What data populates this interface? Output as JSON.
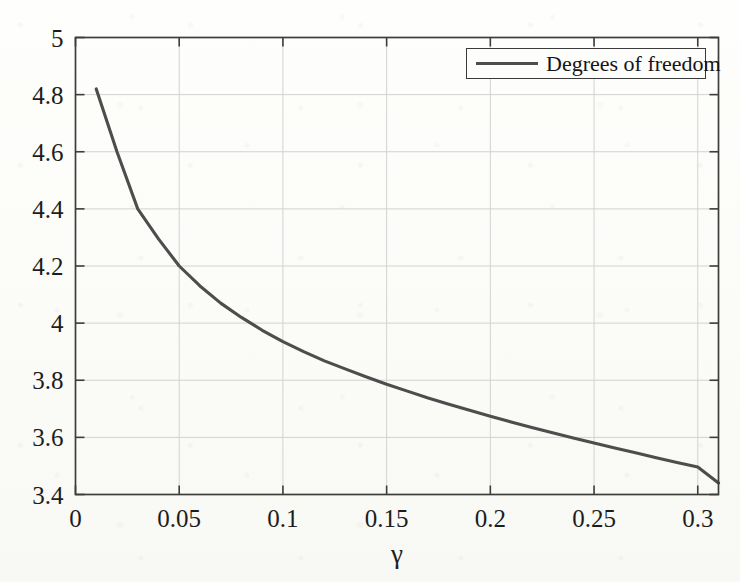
{
  "chart_data": {
    "type": "line",
    "title": "",
    "xlabel": "γ",
    "ylabel": "",
    "xlim": [
      0,
      0.31
    ],
    "ylim": [
      3.4,
      5.0
    ],
    "grid": true,
    "legend_position": "top-right",
    "x_ticks": [
      "0",
      "0.05",
      "0.1",
      "0.15",
      "0.2",
      "0.25",
      "0.3"
    ],
    "x_tick_values": [
      0,
      0.05,
      0.1,
      0.15,
      0.2,
      0.25,
      0.3
    ],
    "y_ticks": [
      "3.4",
      "3.6",
      "3.8",
      "4",
      "4.2",
      "4.4",
      "4.6",
      "4.8",
      "5"
    ],
    "y_tick_values": [
      3.4,
      3.6,
      3.8,
      4.0,
      4.2,
      4.4,
      4.6,
      4.8,
      5.0
    ],
    "series": [
      {
        "name": "Degrees of freedom",
        "color": "#4d4d4d",
        "x": [
          0.01,
          0.02,
          0.03,
          0.04,
          0.05,
          0.06,
          0.07,
          0.08,
          0.09,
          0.1,
          0.11,
          0.12,
          0.13,
          0.14,
          0.15,
          0.16,
          0.17,
          0.18,
          0.19,
          0.2,
          0.21,
          0.22,
          0.23,
          0.24,
          0.25,
          0.26,
          0.27,
          0.28,
          0.29,
          0.3,
          0.31
        ],
        "values": [
          4.82,
          4.6,
          4.4,
          4.295,
          4.2,
          4.13,
          4.07,
          4.02,
          3.975,
          3.935,
          3.9,
          3.868,
          3.84,
          3.812,
          3.786,
          3.762,
          3.738,
          3.716,
          3.695,
          3.674,
          3.654,
          3.635,
          3.616,
          3.598,
          3.58,
          3.563,
          3.546,
          3.529,
          3.512,
          3.496,
          3.44
        ]
      }
    ]
  },
  "legend": {
    "entries": [
      {
        "label": "Degrees of freedom"
      }
    ]
  },
  "axes": {
    "x_title": "γ"
  }
}
